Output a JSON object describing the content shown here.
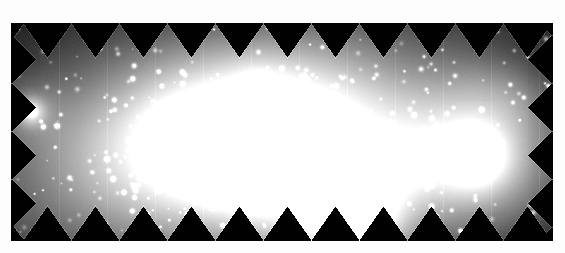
{
  "page": {
    "background_color": "#ffffff",
    "width": 565,
    "height": 253
  },
  "figure": {
    "name": "sawtooth-mosaic-field",
    "frame": {
      "x": 11,
      "y": 23,
      "width": 542,
      "height": 218,
      "fill_color": "#000000",
      "border_color": "#ffffff"
    },
    "colormap": "greyscale",
    "corner_mark": "."
  },
  "mosaic_edges": {
    "tooth_period_px": 48,
    "tooth_amplitude_px": 34,
    "top_orientation": "peaks-up",
    "bottom_orientation": "peaks-down",
    "left_orientation": "peaks-left",
    "right_orientation": "peaks-right",
    "seam_line_color": "#2a2a2a"
  },
  "chart_data": {
    "type": "scatter",
    "title": "",
    "xlabel": "",
    "ylabel": "",
    "xlim": [
      0,
      542
    ],
    "ylim": [
      0,
      218
    ],
    "grid": false,
    "legend": "none",
    "nebulosity": [
      {
        "name": "central-diffuse-halo",
        "cx": 235,
        "cy": 125,
        "rx": 175,
        "ry": 88,
        "peak": 0.46,
        "rot": -8
      },
      {
        "name": "core-bridge",
        "cx": 230,
        "cy": 120,
        "rx": 110,
        "ry": 52,
        "peak": 0.58,
        "rot": -10
      },
      {
        "name": "southwest-plume",
        "cx": 300,
        "cy": 165,
        "rx": 70,
        "ry": 50,
        "peak": 0.4,
        "rot": 15
      },
      {
        "name": "north-extension",
        "cx": 250,
        "cy": 70,
        "rx": 85,
        "ry": 48,
        "peak": 0.26,
        "rot": 0
      },
      {
        "name": "west-low-surface-br",
        "cx": 125,
        "cy": 118,
        "rx": 85,
        "ry": 55,
        "peak": 0.18,
        "rot": 5
      },
      {
        "name": "east-filament",
        "cx": 370,
        "cy": 130,
        "rx": 70,
        "ry": 42,
        "peak": 0.15,
        "rot": -5
      },
      {
        "name": "companion-halo-east",
        "cx": 465,
        "cy": 133,
        "rx": 55,
        "ry": 48,
        "peak": 0.5,
        "rot": 0
      },
      {
        "name": "faint-patch-northeast",
        "cx": 492,
        "cy": 72,
        "rx": 34,
        "ry": 22,
        "peak": 0.14,
        "rot": 20
      },
      {
        "name": "faint-patch-midfield",
        "cx": 390,
        "cy": 140,
        "rx": 26,
        "ry": 20,
        "peak": 0.17,
        "rot": 0
      },
      {
        "name": "south-bright-wedge",
        "cx": 345,
        "cy": 200,
        "rx": 28,
        "ry": 26,
        "peak": 0.55,
        "rot": 0
      },
      {
        "name": "southeast-glow",
        "cx": 330,
        "cy": 175,
        "rx": 44,
        "ry": 30,
        "peak": 0.3,
        "rot": 0
      }
    ],
    "bright_knots": [
      {
        "name": "knot-A-west-core",
        "cx": 174,
        "cy": 116,
        "r": 11,
        "peak": 1.0
      },
      {
        "name": "knot-B-main-core",
        "cx": 252,
        "cy": 118,
        "r": 13,
        "peak": 1.0
      },
      {
        "name": "knot-C-south-core",
        "cx": 212,
        "cy": 140,
        "r": 8,
        "peak": 0.92
      },
      {
        "name": "knot-D-east-core",
        "cx": 266,
        "cy": 132,
        "r": 7,
        "peak": 0.8
      },
      {
        "name": "knot-E-companion",
        "cx": 465,
        "cy": 133,
        "r": 14,
        "peak": 1.0
      },
      {
        "name": "knot-F-west-star",
        "cx": 20,
        "cy": 88,
        "r": 6,
        "peak": 0.95
      },
      {
        "name": "knot-G-south-wedge",
        "cx": 347,
        "cy": 205,
        "r": 9,
        "peak": 0.85
      },
      {
        "name": "knot-H-north-clump",
        "cx": 246,
        "cy": 62,
        "r": 5,
        "peak": 0.62
      },
      {
        "name": "knot-I-inner-south",
        "cx": 230,
        "cy": 155,
        "r": 6,
        "peak": 0.7
      },
      {
        "name": "knot-J-mid",
        "cx": 196,
        "cy": 132,
        "r": 5,
        "peak": 0.66
      }
    ],
    "point_source_count": 520,
    "point_source_size_range_px": [
      1,
      3
    ],
    "background_level": 0.02
  },
  "a11y": {
    "image_alt": "Greyscale astronomical mosaic showing a bright extended nebulous region across the centre with numerous point sources and a bright compact source toward the right; the field boundary is a sawtooth pattern from overlapping detector pointings."
  }
}
